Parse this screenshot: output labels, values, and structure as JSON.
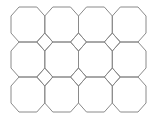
{
  "diagram": {
    "type": "truncated-square-tiling",
    "grid": {
      "columns": 4,
      "rows": 3
    },
    "origin": {
      "x": 11,
      "y": 7
    },
    "cell": {
      "width": 33.75,
      "height": 35
    },
    "corner_cut": {
      "x": 8,
      "y": 9
    },
    "stroke_color": "#8a8a8a",
    "background_color": "#ffffff"
  }
}
